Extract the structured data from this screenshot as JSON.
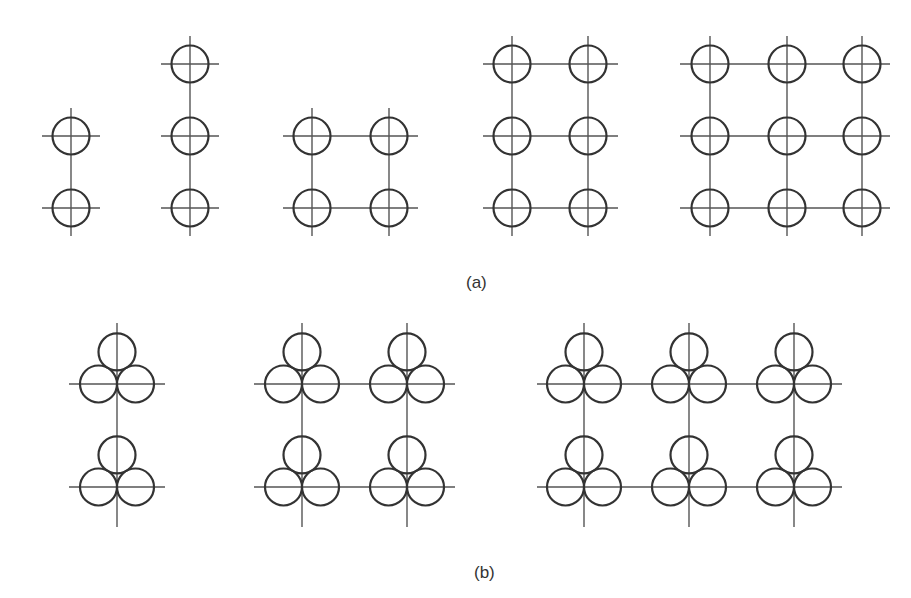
{
  "figure": {
    "stroke_color": "#333333",
    "line_color": "#555555",
    "circle_radius": 18.5,
    "panel_a": {
      "label": "(a)",
      "description": "Single conductors per phase arranged on rectangular grid lines",
      "groups": [
        {
          "name": "1x2",
          "cols_x": [
            71
          ],
          "rows_y": [
            136,
            208
          ],
          "v_extent": [
            108,
            236
          ],
          "h_extent": [
            42,
            100
          ]
        },
        {
          "name": "1x3",
          "cols_x": [
            190
          ],
          "rows_y": [
            64,
            136,
            208
          ],
          "v_extent": [
            36,
            236
          ],
          "h_extent": [
            161,
            219
          ]
        },
        {
          "name": "2x2",
          "cols_x": [
            312,
            389
          ],
          "rows_y": [
            136,
            208
          ],
          "v_extent": [
            108,
            236
          ],
          "h_extent": [
            283,
            418
          ]
        },
        {
          "name": "2x3",
          "cols_x": [
            512,
            588
          ],
          "rows_y": [
            64,
            136,
            208
          ],
          "v_extent": [
            36,
            236
          ],
          "h_extent": [
            483,
            618
          ]
        },
        {
          "name": "3x3",
          "cols_x": [
            710,
            787,
            862
          ],
          "rows_y": [
            64,
            136,
            208
          ],
          "v_extent": [
            36,
            236
          ],
          "h_extent": [
            680,
            890
          ]
        }
      ]
    },
    "panel_b": {
      "label": "(b)",
      "description": "Trefoil arrangements (three touching circles) on grid lines",
      "groups": [
        {
          "name": "1x2",
          "cols_x": [
            117
          ],
          "rows_y": [
            384,
            487
          ],
          "v_extent": [
            323,
            527
          ],
          "h_extent": [
            69,
            165
          ]
        },
        {
          "name": "2x2",
          "cols_x": [
            302,
            407
          ],
          "rows_y": [
            384,
            487
          ],
          "v_extent": [
            323,
            527
          ],
          "h_extent": [
            254,
            455
          ]
        },
        {
          "name": "3x2",
          "cols_x": [
            584,
            689,
            794
          ],
          "rows_y": [
            384,
            487
          ],
          "v_extent": [
            323,
            527
          ],
          "h_extent": [
            537,
            842
          ]
        }
      ]
    }
  }
}
